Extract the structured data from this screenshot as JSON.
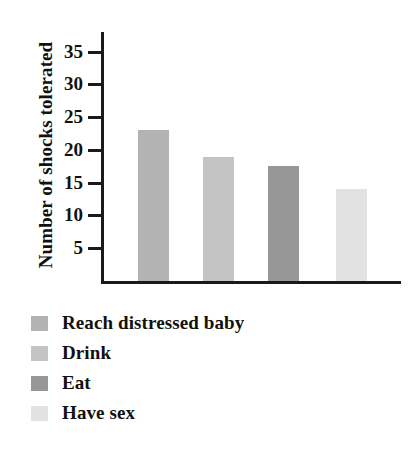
{
  "chart_data": {
    "type": "bar",
    "title": "",
    "xlabel": "",
    "ylabel": "Number of shocks tolerated",
    "categories": [
      "Reach distressed baby",
      "Drink",
      "Eat",
      "Have sex"
    ],
    "values": [
      23,
      19,
      17.5,
      14
    ],
    "series": [
      {
        "name": "Number of shocks tolerated",
        "values": [
          23,
          19,
          17.5,
          14
        ]
      }
    ],
    "ylim": [
      0,
      38
    ],
    "y_ticks": [
      5,
      10,
      15,
      20,
      25,
      30,
      35
    ],
    "y_tick_labels": [
      "5",
      "10",
      "15",
      "20",
      "25",
      "30",
      "35"
    ],
    "x_tick_labels": [],
    "grid": false,
    "legend_position": "below",
    "bar_colors": [
      "#b3b3b3",
      "#c4c4c4",
      "#979797",
      "#e2e2e2"
    ],
    "axis_color": "#1a1a1a"
  },
  "legend": {
    "items": [
      {
        "label": "Reach distressed baby",
        "color": "#b3b3b3"
      },
      {
        "label": "Drink",
        "color": "#c4c4c4"
      },
      {
        "label": "Eat",
        "color": "#979797"
      },
      {
        "label": "Have sex",
        "color": "#e2e2e2"
      }
    ]
  },
  "axis": {
    "y_title": "Number of shocks tolerated"
  }
}
